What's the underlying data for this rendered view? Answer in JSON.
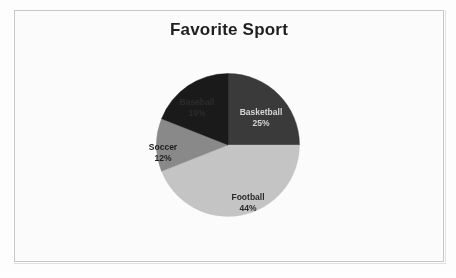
{
  "page": {
    "background_color": "#ffffff",
    "border_color": "#c9c9c9"
  },
  "chart_data": {
    "type": "pie",
    "title": "Favorite Sport",
    "xlabel": "",
    "ylabel": "",
    "legend_position": "none",
    "labels_position": "inside-slices",
    "start_angle_deg": 0,
    "direction": "clockwise",
    "categories": [
      "Basketball",
      "Football",
      "Soccer",
      "Baseball"
    ],
    "values": [
      25,
      44,
      12,
      19
    ],
    "value_unit": "percent",
    "slices": [
      {
        "name": "Basketball",
        "value": 25,
        "percent_text": "25%",
        "color": "#3a3a3a",
        "label_text_color": "#d8d8d8",
        "start_deg": 0,
        "end_deg": 90
      },
      {
        "name": "Football",
        "value": 44,
        "percent_text": "44%",
        "color": "#c6c6c6",
        "label_text_color": "#2a2a2a",
        "start_deg": 90,
        "end_deg": 248.4
      },
      {
        "name": "Soccer",
        "value": 12,
        "percent_text": "12%",
        "color": "#8a8a8a",
        "label_text_color": "#1d1d1d",
        "start_deg": 248.4,
        "end_deg": 291.6
      },
      {
        "name": "Baseball",
        "value": 19,
        "percent_text": "19%",
        "color": "#1a1a1a",
        "label_text_color": "#2e2e2e",
        "start_deg": 291.6,
        "end_deg": 360
      }
    ]
  }
}
